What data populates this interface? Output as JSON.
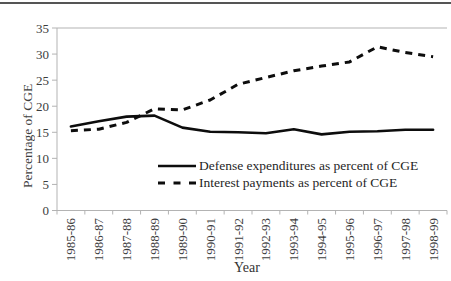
{
  "chart_data": {
    "type": "line",
    "title": "",
    "xlabel": "Year",
    "ylabel": "Percentage of CGE",
    "ylim": [
      0,
      35
    ],
    "yticks": [
      0,
      5,
      10,
      15,
      20,
      25,
      30,
      35
    ],
    "grid": false,
    "legend_position": "inside-bottom-center",
    "line_color": "#0d0d0d",
    "axis_color": "#b3b3b3",
    "categories": [
      "1985-86",
      "1986-87",
      "1987-88",
      "1988-89",
      "1989-90",
      "1990-91",
      "1991-92",
      "1992-93",
      "1993-94",
      "1994-95",
      "1995-96",
      "1996-97",
      "1997-98",
      "1998-99"
    ],
    "series": [
      {
        "name": "Defense expenditures as percent of CGE",
        "line_style": "solid",
        "values": [
          16.1,
          17.1,
          18.0,
          18.2,
          15.9,
          15.1,
          15.0,
          14.8,
          15.6,
          14.6,
          15.1,
          15.2,
          15.5,
          15.5
        ]
      },
      {
        "name": "Interest payments as percent of CGE",
        "line_style": "dashed",
        "values": [
          15.3,
          15.6,
          16.9,
          19.5,
          19.3,
          21.2,
          24.2,
          25.5,
          26.8,
          27.7,
          28.5,
          31.4,
          30.3,
          29.5
        ]
      }
    ]
  }
}
